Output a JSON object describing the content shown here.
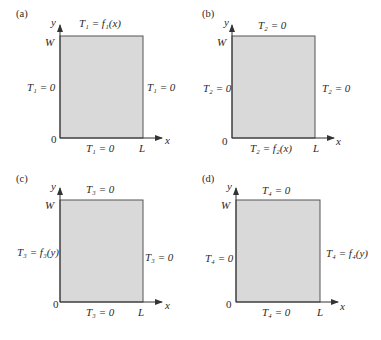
{
  "figure": {
    "panels": [
      {
        "tag": "(a)",
        "axis_y": "y",
        "axis_x": "x",
        "top_label": "W",
        "origin": "0",
        "right_label": "L",
        "bc_top": "T₁ = f₁(x)",
        "bc_left": "T₁ = 0",
        "bc_right": "T₁ = 0",
        "bc_bottom": "T₁ = 0"
      },
      {
        "tag": "(b)",
        "axis_y": "y",
        "axis_x": "x",
        "top_label": "W",
        "origin": "0",
        "right_label": "L",
        "bc_top": "T₂ = 0",
        "bc_left": "T₂ = 0",
        "bc_right": "T₂ = 0",
        "bc_bottom": "T₂ = f₂(x)"
      },
      {
        "tag": "(c)",
        "axis_y": "y",
        "axis_x": "x",
        "top_label": "W",
        "origin": "0",
        "right_label": "L",
        "bc_top": "T₃ = 0",
        "bc_left": "T₃ = f₃(y)",
        "bc_right": "T₃ = 0",
        "bc_bottom": "T₃ = 0"
      },
      {
        "tag": "(d)",
        "axis_y": "y",
        "axis_x": "x",
        "top_label": "W",
        "origin": "0",
        "right_label": "L",
        "bc_top": "T₄ = 0",
        "bc_left": "T₄ = 0",
        "bc_right": "T₄ = f₄(y)",
        "bc_bottom": "T₄ = 0"
      }
    ],
    "colors": {
      "fill": "#d9d9d9",
      "stroke": "#555555"
    }
  }
}
